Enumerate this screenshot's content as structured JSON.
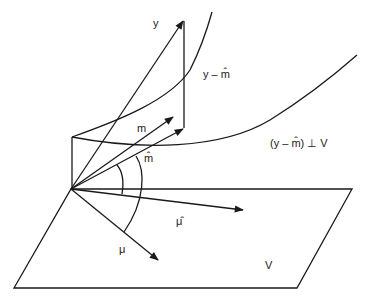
{
  "diagram": {
    "labels": {
      "y": "y",
      "residual": "y – m̂",
      "m": "m",
      "m_hat": "m̂",
      "orthogonality": "(y – m̂) ⊥ V",
      "mu_hat": "μ̂",
      "mu": "μ",
      "plane": "V"
    },
    "stroke_color": "#1a1a1a",
    "background": "#ffffff"
  }
}
